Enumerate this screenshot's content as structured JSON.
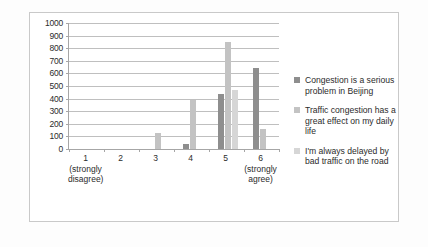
{
  "chart_data": {
    "type": "bar",
    "title": "",
    "subtitle": "",
    "xlabel": "",
    "ylabel": "",
    "categories": [
      "1",
      "2",
      "3",
      "4",
      "5",
      "6"
    ],
    "category_sublabels": [
      "(strongly disagree)",
      "",
      "",
      "",
      "",
      "(strongly agree)"
    ],
    "ylim": [
      0,
      1000
    ],
    "yticks": [
      0,
      100,
      200,
      300,
      400,
      500,
      600,
      700,
      800,
      900,
      1000
    ],
    "ytick_labels": [
      "0",
      "100",
      "200",
      "300",
      "400",
      "500",
      "600",
      "700",
      "800",
      "900",
      "1000"
    ],
    "grid": true,
    "legend_position": "right",
    "series": [
      {
        "name": "Congestion is a serious problem in Beijing",
        "color": "#8e8e8e",
        "values": [
          0,
          0,
          0,
          40,
          440,
          640
        ]
      },
      {
        "name": "Traffic congestion has a great effect on my daily life",
        "color": "#c3c3c3",
        "values": [
          0,
          0,
          130,
          390,
          850,
          160
        ]
      },
      {
        "name": "I'm always delayed by bad traffic on the road",
        "color": "#d6d6d6",
        "values": [
          0,
          0,
          0,
          0,
          470,
          0
        ]
      }
    ]
  },
  "axis": {
    "y_ticks": [
      {
        "label": "1000"
      },
      {
        "label": "900"
      },
      {
        "label": "800"
      },
      {
        "label": "700"
      },
      {
        "label": "600"
      },
      {
        "label": "500"
      },
      {
        "label": "400"
      },
      {
        "label": "300"
      },
      {
        "label": "200"
      },
      {
        "label": "100"
      },
      {
        "label": "0"
      }
    ],
    "x_ticks": [
      {
        "num": "1",
        "sub": "(strongly",
        "sub2": "disagree)"
      },
      {
        "num": "2",
        "sub": "",
        "sub2": ""
      },
      {
        "num": "3",
        "sub": "",
        "sub2": ""
      },
      {
        "num": "4",
        "sub": "",
        "sub2": ""
      },
      {
        "num": "5",
        "sub": "",
        "sub2": ""
      },
      {
        "num": "6",
        "sub": "(strongly",
        "sub2": "agree)"
      }
    ]
  },
  "legend": {
    "items": [
      {
        "label": "Congestion is a serious problem in Beijing",
        "color": "#8e8e8e"
      },
      {
        "label": "Traffic congestion has a great effect on my daily life",
        "color": "#c3c3c3"
      },
      {
        "label": "I'm always delayed by bad traffic on the road",
        "color": "#d6d6d6"
      }
    ]
  }
}
